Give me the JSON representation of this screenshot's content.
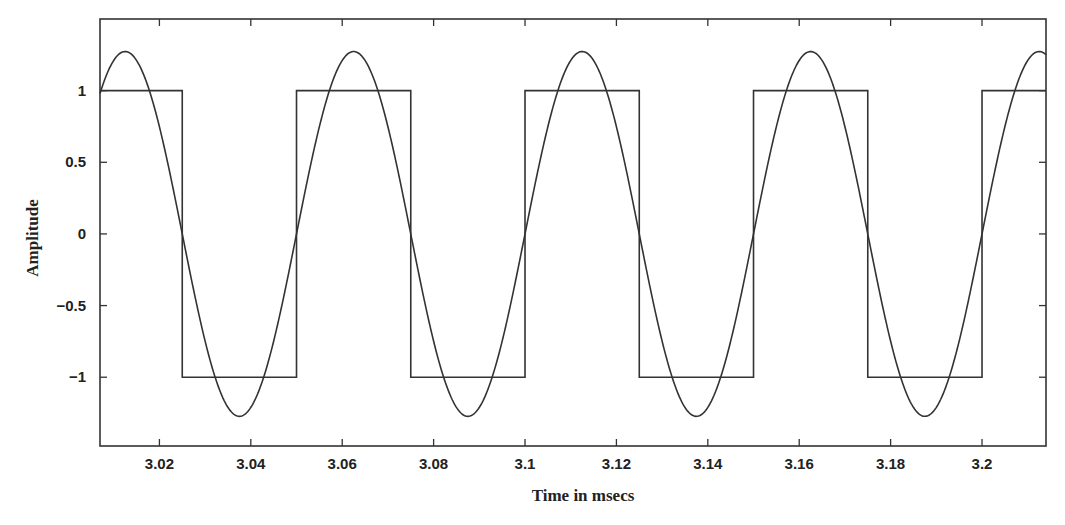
{
  "chart_data": {
    "type": "line",
    "title": "",
    "xlabel": "Time in msecs",
    "ylabel": "Amplitude",
    "xlim": [
      3.007,
      3.214
    ],
    "ylim": [
      -1.48,
      1.5
    ],
    "grid": false,
    "legend": null,
    "x_ticks": [
      3.02,
      3.04,
      3.06,
      3.08,
      3.1,
      3.12,
      3.14,
      3.16,
      3.18,
      3.2
    ],
    "x_tick_labels": [
      "3.02",
      "3.04",
      "3.06",
      "3.08",
      "3.1",
      "3.12",
      "3.14",
      "3.16",
      "3.18",
      "3.2"
    ],
    "y_ticks": [
      1,
      0.5,
      0,
      -0.5,
      -1
    ],
    "y_tick_labels": [
      "1",
      "0.5",
      "0",
      "−0.5",
      "−1"
    ],
    "series": [
      {
        "name": "Square wave",
        "kind": "step",
        "period_ms": 0.05,
        "amplitude": 1,
        "x": [
          3.007,
          3.025,
          3.025,
          3.05,
          3.05,
          3.075,
          3.075,
          3.1,
          3.1,
          3.125,
          3.125,
          3.15,
          3.15,
          3.175,
          3.175,
          3.2,
          3.2,
          3.214
        ],
        "values": [
          1,
          1,
          -1,
          -1,
          1,
          1,
          -1,
          -1,
          1,
          1,
          -1,
          -1,
          1,
          1,
          -1,
          -1,
          1,
          1
        ]
      },
      {
        "name": "Fundamental sinusoid",
        "kind": "sine",
        "period_ms": 0.05,
        "amplitude": 1.273,
        "phase_origin_ms": 3.0,
        "peaks_x": [
          3.0125,
          3.0625,
          3.1125,
          3.1625,
          3.2125
        ],
        "troughs_x": [
          3.0375,
          3.0875,
          3.1375,
          3.1875
        ],
        "peak_value": 1.27,
        "trough_value": -1.27
      }
    ]
  }
}
